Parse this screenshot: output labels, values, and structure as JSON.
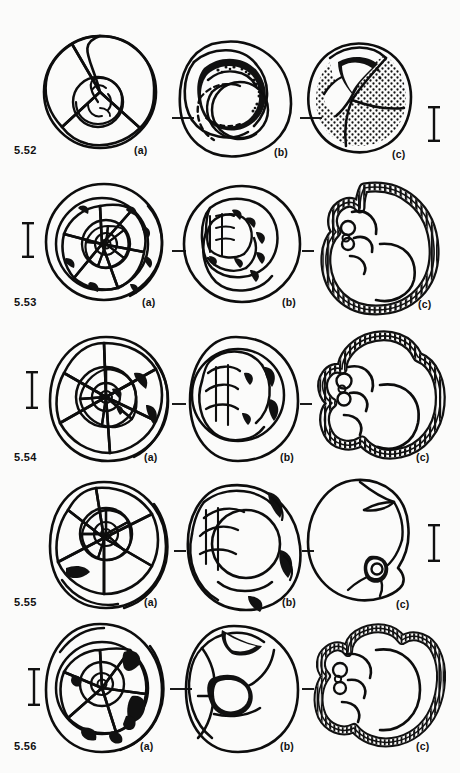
{
  "plate": {
    "title": "Foraminifera morphology plate",
    "background_color": "#fbfbfa",
    "ink_color": "#0d0d0d",
    "view_labels": {
      "a": "(a)",
      "b": "(b)",
      "c": "(c)"
    },
    "rows": [
      {
        "figure_number": "5.52",
        "scalebar_side": "right",
        "panels": [
          {
            "view": "(a)",
            "view_key": "a",
            "description": "spiral view, trochospiral coil, 4 chambers in final whorl"
          },
          {
            "view": "(b)",
            "view_key": "b",
            "description": "apertural edge view, dark umbilical aperture with toothed rim"
          },
          {
            "view": "(c)",
            "view_key": "c",
            "description": "umbilical view, stippled surface texture, dark aperture"
          }
        ]
      },
      {
        "figure_number": "5.53",
        "scalebar_side": "left",
        "panels": [
          {
            "view": "(a)",
            "view_key": "a",
            "description": "spiral view, tightly coiled, dark sutural nodes"
          },
          {
            "view": "(b)",
            "view_key": "b",
            "description": "edge view, chamber series with dark marginal nodes"
          },
          {
            "view": "(c)",
            "view_key": "c",
            "description": "axial section, radially hatched wall, chamber lumina"
          }
        ]
      },
      {
        "figure_number": "5.54",
        "scalebar_side": "left",
        "panels": [
          {
            "view": "(a)",
            "view_key": "a",
            "description": "spiral view, involute coil, dark sutural patches"
          },
          {
            "view": "(b)",
            "view_key": "b",
            "description": "edge view with dark apertural area"
          },
          {
            "view": "(c)",
            "view_key": "c",
            "description": "axial section, hatched wall, lobate outline"
          }
        ]
      },
      {
        "figure_number": "5.55",
        "scalebar_side": "right",
        "panels": [
          {
            "view": "(a)",
            "view_key": "a",
            "description": "spiral view, low trochospire, small dark aperture"
          },
          {
            "view": "(b)",
            "view_key": "b",
            "description": "edge view, keeled periphery, dark apertural flap"
          },
          {
            "view": "(c)",
            "view_key": "c",
            "description": "apertural view, keeled outline, small dark aperture"
          }
        ]
      },
      {
        "figure_number": "5.56",
        "scalebar_side": "left",
        "panels": [
          {
            "view": "(a)",
            "view_key": "a",
            "description": "spiral view, dark irregular sutural infills"
          },
          {
            "view": "(b)",
            "view_key": "b",
            "description": "edge view, star-shaped dark aperture"
          },
          {
            "view": "(c)",
            "view_key": "c",
            "description": "axial section, finely hatched wall, globular chambers"
          }
        ]
      }
    ]
  }
}
